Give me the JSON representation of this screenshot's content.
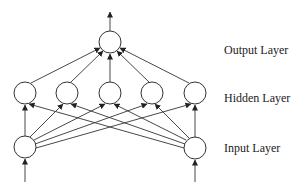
{
  "diagram": {
    "type": "feed-forward neural network",
    "labels": {
      "output": "Output Layer",
      "hidden": "Hidden Layer",
      "input": "Input Layer"
    },
    "layers": [
      {
        "name": "input",
        "count": 2
      },
      {
        "name": "hidden",
        "count": 5
      },
      {
        "name": "output",
        "count": 1
      }
    ],
    "connections": "fully-connected input→hidden, hidden→output",
    "colors": {
      "stroke": "#333333",
      "background": "#ffffff"
    }
  }
}
